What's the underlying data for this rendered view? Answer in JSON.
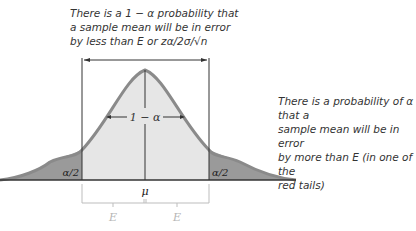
{
  "diagram": {
    "top_note": {
      "line1": "There is a 1 − α probability that",
      "line2": "a sample mean will be in error",
      "line3": "by less than E or zα/2σ/√n"
    },
    "right_note": {
      "line1": "There is a probability of α that a",
      "line2": "sample mean will be in error",
      "line3": "by more than E (in one of the",
      "line4": "red tails)"
    },
    "center_label": "1 − α",
    "left_tail_label": "α/2",
    "right_tail_label": "α/2",
    "mean_label": "μ",
    "left_error_label": "E",
    "right_error_label": "E",
    "colors": {
      "curve": "#8a8a8a",
      "center_fill": "#e6e6e6",
      "tail_fill": "#9a9a9a",
      "error_bracket": "#bdbdbd"
    }
  }
}
